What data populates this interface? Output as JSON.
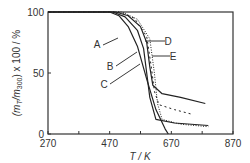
{
  "chart_data": {
    "type": "line",
    "title": "",
    "xlabel": "T / K",
    "ylabel": "(m_T/m_300) x 100 / %",
    "xlim": [
      270,
      870
    ],
    "ylim": [
      0,
      100
    ],
    "x_ticks": [
      "270",
      "470",
      "670",
      "870"
    ],
    "y_ticks": [
      "0",
      "50",
      "100"
    ],
    "grid": false,
    "legend_position": "inline annotations",
    "series": [
      {
        "name": "A",
        "style": "solid",
        "x": [
          270,
          470,
          500,
          530,
          560,
          590,
          620,
          650,
          660
        ],
        "values": [
          100,
          100,
          97,
          88,
          72,
          45,
          20,
          4,
          0
        ]
      },
      {
        "name": "B",
        "style": "solid",
        "x": [
          270,
          480,
          520,
          560,
          580,
          590,
          600,
          620,
          680,
          790
        ],
        "values": [
          100,
          100,
          96,
          85,
          70,
          50,
          30,
          12,
          9,
          7
        ]
      },
      {
        "name": "C",
        "style": "solid",
        "x": [
          270,
          490,
          530,
          570,
          590,
          600,
          610,
          640,
          700,
          780
        ],
        "values": [
          100,
          100,
          97,
          88,
          75,
          55,
          40,
          33,
          30,
          25
        ]
      },
      {
        "name": "D",
        "style": "dashed",
        "x": [
          270,
          500,
          550,
          590,
          605,
          615,
          630,
          680,
          740
        ],
        "values": [
          100,
          100,
          95,
          80,
          55,
          35,
          24,
          20,
          16
        ]
      },
      {
        "name": "E",
        "style": "dotted",
        "x": [
          270,
          510,
          560,
          600,
          615,
          625,
          640,
          700,
          790
        ],
        "values": [
          100,
          100,
          94,
          78,
          50,
          25,
          12,
          8,
          6
        ]
      }
    ],
    "annotations": [
      "A",
      "B",
      "C",
      "D",
      "E"
    ]
  },
  "axes": {
    "x_label": "T / K",
    "y_label_prefix": "(m",
    "y_label_sub1": "T",
    "y_label_mid": "/m",
    "y_label_sub2": "300",
    "y_label_suffix": ") x 100 / %"
  }
}
